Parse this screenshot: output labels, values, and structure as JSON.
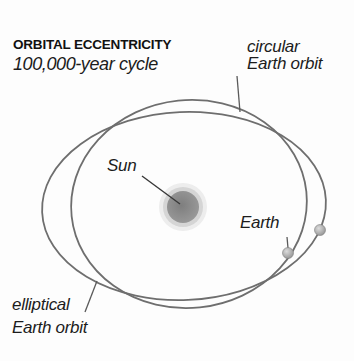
{
  "title": {
    "heading": "ORBITAL ECCENTRICITY",
    "subtitle": "100,000-year cycle"
  },
  "labels": {
    "circular_orbit_line1": "circular",
    "circular_orbit_line2": "Earth orbit",
    "sun": "Sun",
    "earth": "Earth",
    "elliptical_orbit_line1": "elliptical",
    "elliptical_orbit_line2": "Earth orbit"
  },
  "colors": {
    "background": "#fdfdfd",
    "text": "#1c1c1c",
    "orbit_stroke": "#6e6e6e",
    "pointer_stroke": "#5a5a5a",
    "sun_pointer_stroke": "#383838",
    "sun_halo_outer": "#ededed",
    "sun_halo_inner": "#d5d5d5",
    "sun_core_center": "#7e7e7e",
    "sun_core_edge": "#9a9a9a",
    "earth_dot_highlight": "#dcdcdc",
    "earth_dot_base": "#8f8f8f"
  },
  "diagram": {
    "type": "orbital-eccentricity-cycle",
    "description_from_pixels": "Two overlapping Earth orbits around the Sun: a rounder circular orbit and a wider flatter elliptical orbit, with Earth shown as a small sphere on each orbit"
  }
}
